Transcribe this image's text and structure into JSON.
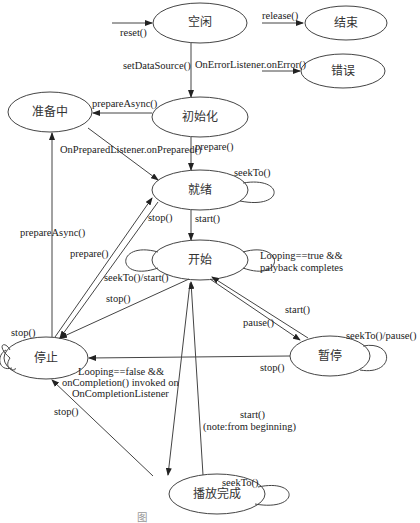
{
  "states": {
    "idle": "空闲",
    "end": "结束",
    "error": "错误",
    "preparing": "准备中",
    "initialized": "初始化",
    "prepared": "就绪",
    "started": "开始",
    "stopped": "停止",
    "paused": "暂停",
    "completed": "播放完成"
  },
  "transitions": {
    "reset": "reset()",
    "release": "release()",
    "on_error": "OnErrorListener.onError()",
    "set_data_source": "setDataSource()",
    "prepare_async_init": "prepareAsync()",
    "on_prepared": "OnPreparedListener.onPrepared()",
    "prepare_init": "prepare()",
    "seek_prepared": "seekTo()",
    "stop_prepared": "stop()",
    "start_prepared": "start()",
    "prepare_async_stopped": "prepareAsync()",
    "prepare_stopped": "prepare()",
    "seek_start_started": "seekTo()/start()",
    "stop_started": "stop()",
    "looping_true_1": "Looping==true &&",
    "looping_true_2": "palyback completes",
    "start_paused": "start()",
    "pause": "pause()",
    "seek_pause_paused": "seekTo()/pause()",
    "stop_paused": "stop()",
    "stop_stopped": "stop()",
    "looping_false_1": "Looping==false &&",
    "looping_false_2": "onCompletion() invoked on",
    "looping_false_3": "OnCompletionListener",
    "stop_completed": "stop()",
    "start_completed_1": "start()",
    "start_completed_2": "(note:from beginning)",
    "seek_completed": "seekTo()"
  },
  "caption": "图"
}
